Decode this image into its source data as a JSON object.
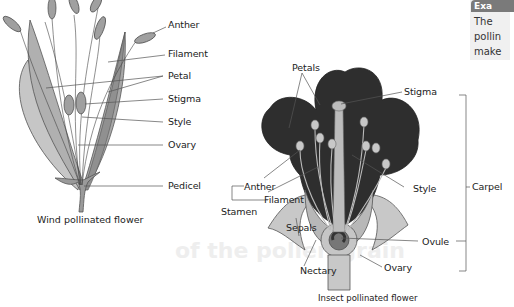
{
  "background_text": {
    "heading_fragment": "of the pollen grain"
  },
  "side_box": {
    "tag": "Exa",
    "lines": [
      "The",
      "pollin",
      "make"
    ]
  },
  "wind_flower": {
    "caption": "Wind pollinated flower",
    "labels": {
      "anther": "Anther",
      "filament": "Filament",
      "petal": "Petal",
      "stigma": "Stigma",
      "style": "Style",
      "ovary": "Ovary",
      "pedicel": "Pedicel"
    }
  },
  "insect_flower": {
    "caption": "Insect pollinated flower",
    "labels": {
      "petals": "Petals",
      "stigma": "Stigma",
      "carpel": "Carpel",
      "anther": "Anther",
      "filament": "Filament",
      "stamen": "Stamen",
      "style": "Style",
      "sepals": "Sepals",
      "ovule": "Ovule",
      "nectary": "Nectary",
      "ovary": "Ovary"
    }
  }
}
